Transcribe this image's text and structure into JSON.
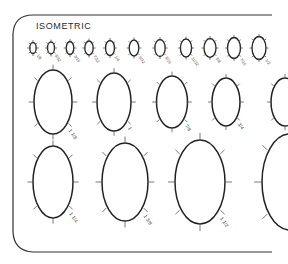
{
  "template": {
    "title": "ISOMETRIC",
    "stroke_color": "#222222",
    "tick_color": "#555555",
    "label_color": "#444444",
    "background": "#ffffff"
  },
  "rows": [
    {
      "name": "small",
      "cy": 48,
      "ellipses": [
        {
          "cx": 33,
          "rx": 3.2,
          "ry": 5.5,
          "label": "1/8"
        },
        {
          "cx": 51,
          "rx": 3.5,
          "ry": 6,
          "label": "5/32"
        },
        {
          "cx": 70,
          "rx": 3.8,
          "ry": 6.5,
          "label": "3/16"
        },
        {
          "cx": 89,
          "rx": 4.2,
          "ry": 7,
          "label": "7/32"
        },
        {
          "cx": 110,
          "rx": 4.5,
          "ry": 7.5,
          "label": "1/4"
        },
        {
          "cx": 134,
          "rx": 4.8,
          "ry": 8,
          "label": "9/32"
        },
        {
          "cx": 160,
          "rx": 5.2,
          "ry": 8.5,
          "label": "5/16"
        },
        {
          "cx": 186,
          "rx": 5.6,
          "ry": 9,
          "label": "11/32"
        },
        {
          "cx": 210,
          "rx": 6,
          "ry": 9.5,
          "label": "3/8"
        },
        {
          "cx": 234,
          "rx": 6.5,
          "ry": 10.5,
          "label": "7/16"
        },
        {
          "cx": 259,
          "rx": 7,
          "ry": 11.5,
          "label": "1/2"
        }
      ]
    },
    {
      "name": "medium",
      "cy": 102,
      "ellipses": [
        {
          "cx": 53,
          "rx": 19,
          "ry": 32,
          "label": "1 1/8"
        },
        {
          "cx": 114,
          "rx": 17,
          "ry": 29,
          "label": "1"
        },
        {
          "cx": 172,
          "rx": 15.5,
          "ry": 26,
          "label": "7/8"
        },
        {
          "cx": 226,
          "rx": 14,
          "ry": 24,
          "label": "3/4"
        },
        {
          "cx": 285,
          "rx": 14,
          "ry": 24,
          "label": ""
        }
      ]
    },
    {
      "name": "large",
      "cy": 182,
      "ellipses": [
        {
          "cx": 53,
          "rx": 20,
          "ry": 36,
          "label": "1 1/4"
        },
        {
          "cx": 125,
          "rx": 23,
          "ry": 39,
          "label": "1 3/8"
        },
        {
          "cx": 200,
          "rx": 25,
          "ry": 42,
          "label": "1 1/2"
        },
        {
          "cx": 290,
          "rx": 28,
          "ry": 48,
          "label": ""
        }
      ]
    }
  ]
}
